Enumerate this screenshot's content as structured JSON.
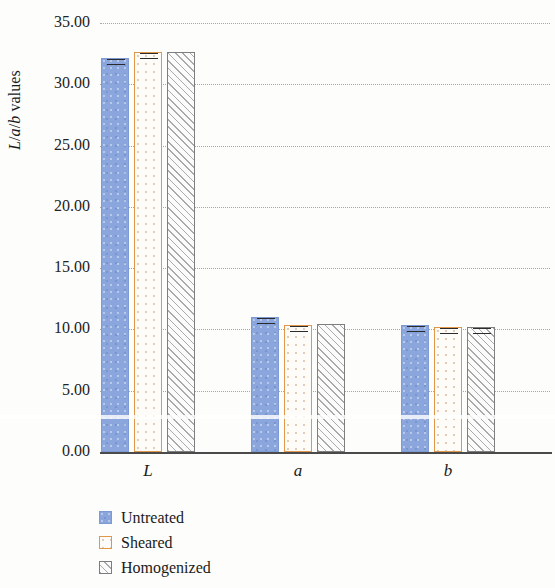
{
  "chart_data": {
    "type": "bar",
    "title": "",
    "xlabel": "",
    "ylabel": "L/a/b values",
    "categories": [
      "L",
      "a",
      "b"
    ],
    "series": [
      {
        "name": "Untreated",
        "values": [
          32.15,
          11.0,
          10.35
        ],
        "errors": [
          0.35,
          0.2,
          0.22
        ],
        "color": "#8aa6dc",
        "fill": "solid-blue"
      },
      {
        "name": "Sheared",
        "values": [
          32.6,
          10.4,
          10.2
        ],
        "errors": [
          0.4,
          0.18,
          0.2
        ],
        "color": "#e0974a",
        "fill": "dotted-orange-outline"
      },
      {
        "name": "Homogenized",
        "values": [
          32.6,
          10.45,
          10.22
        ],
        "errors": [
          0.0,
          0.0,
          0.18
        ],
        "color": "#7e7e7e",
        "fill": "diagonal-hatch-gray"
      }
    ],
    "ylim": [
      0,
      35
    ],
    "ytick_values": [
      0,
      5,
      10,
      15,
      20,
      25,
      30,
      35
    ],
    "ytick_labels": [
      "0.00",
      "5.00",
      "10.00",
      "15.00",
      "20.00",
      "25.00",
      "30.00",
      "35.00"
    ],
    "grid": "horizontal-dotted",
    "legend_position": "bottom-left",
    "error_bars": true
  },
  "axis": {
    "ylabel_parts": {
      "l": "L",
      "slash1": "/",
      "a": "a",
      "slash2": "/",
      "b": "b",
      "rest": " values"
    }
  },
  "legend": {
    "items": [
      {
        "label": "Untreated",
        "swatch": "solid-blue-square-icon"
      },
      {
        "label": "Sheared",
        "swatch": "orange-outline-square-icon"
      },
      {
        "label": "Homogenized",
        "swatch": "hatched-gray-square-icon"
      }
    ]
  }
}
